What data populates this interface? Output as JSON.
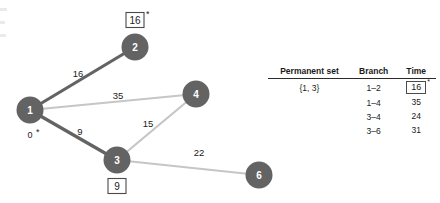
{
  "figure": {
    "graph": {
      "nodes": [
        {
          "id": "1",
          "label": "1",
          "cx": 30,
          "cy": 110,
          "r": 13.5,
          "fill": "#636363"
        },
        {
          "id": "2",
          "label": "2",
          "cx": 135,
          "cy": 47,
          "r": 13.5,
          "fill": "#636363"
        },
        {
          "id": "3",
          "label": "3",
          "cx": 117,
          "cy": 160,
          "r": 13.5,
          "fill": "#636363"
        },
        {
          "id": "4",
          "label": "4",
          "cx": 196,
          "cy": 94,
          "r": 13.5,
          "fill": "#636363"
        },
        {
          "id": "6",
          "label": "6",
          "cx": 259,
          "cy": 175,
          "r": 13.5,
          "fill": "#636363"
        }
      ],
      "edges": [
        {
          "from": "1",
          "to": "2",
          "weight": "16",
          "style": "permanent",
          "color": "#636363",
          "label_x": 78,
          "label_y": 73
        },
        {
          "from": "1",
          "to": "4",
          "weight": "35",
          "style": "candidate",
          "color": "#c6c6c6",
          "label_x": 118,
          "label_y": 95
        },
        {
          "from": "1",
          "to": "3",
          "weight": "9",
          "style": "permanent",
          "color": "#636363",
          "label_x": 80,
          "label_y": 131
        },
        {
          "from": "3",
          "to": "4",
          "weight": "15",
          "style": "candidate",
          "color": "#c6c6c6",
          "label_x": 148,
          "label_y": 123
        },
        {
          "from": "3",
          "to": "6",
          "weight": "22",
          "style": "candidate",
          "color": "#c6c6c6",
          "label_x": 199,
          "label_y": 152
        }
      ],
      "node_annotations": [
        {
          "node": "1",
          "value": "0",
          "boxed": false,
          "starred": true,
          "x": 30,
          "y": 134
        },
        {
          "node": "2",
          "value": "16",
          "boxed": true,
          "starred": true,
          "x": 135,
          "y": 20
        },
        {
          "node": "3",
          "value": "9",
          "boxed": false,
          "starred": false,
          "x": 117,
          "y": 186,
          "box": true
        }
      ]
    }
  },
  "table": {
    "headers": {
      "permanent_set": "Permanent set",
      "branch": "Branch",
      "time": "Time"
    },
    "permanent_set_value": "{1, 3}",
    "rows": [
      {
        "branch": "1–2",
        "time": "16",
        "boxed": true,
        "starred": true
      },
      {
        "branch": "1–4",
        "time": "35",
        "boxed": false,
        "starred": false
      },
      {
        "branch": "3–4",
        "time": "24",
        "boxed": false,
        "starred": false
      },
      {
        "branch": "3–6",
        "time": "31",
        "boxed": false,
        "starred": false
      }
    ]
  },
  "symbols": {
    "star": "*"
  }
}
